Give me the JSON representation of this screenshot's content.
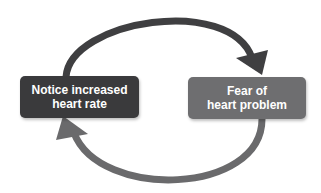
{
  "diagram": {
    "type": "cycle",
    "nodes": [
      {
        "id": "left",
        "label_line1": "Notice increased",
        "label_line2": "heart rate",
        "color": "#3a3a3c"
      },
      {
        "id": "right",
        "label_line1": "Fear of",
        "label_line2": "heart problem",
        "color": "#6e6e70"
      }
    ],
    "edges": [
      {
        "from": "left",
        "to": "right",
        "path": "top-arc",
        "color": "#3f3f41"
      },
      {
        "from": "right",
        "to": "left",
        "path": "bottom-arc",
        "color": "#6a6a6c"
      }
    ]
  }
}
